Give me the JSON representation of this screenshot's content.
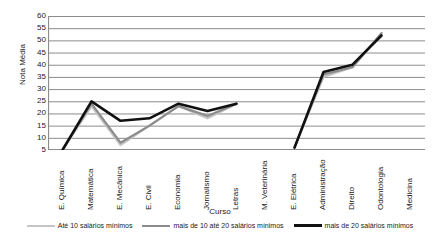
{
  "chart_data": {
    "type": "line",
    "title": "",
    "xlabel": "Curso",
    "ylabel": "Nota Média",
    "ylim": [
      5,
      60
    ],
    "yticks": [
      60,
      55,
      50,
      45,
      40,
      35,
      30,
      25,
      20,
      15,
      10,
      5
    ],
    "grid": true,
    "legend_position": "bottom",
    "categories": [
      "E. Química",
      "Matemática",
      "E. Mecânica",
      "E. Civil",
      "Economia",
      "Jornalismo",
      "Letras",
      "M. Veterinária",
      "E. Elétrica",
      "Administração",
      "Direito",
      "Odontologia",
      "Medicina"
    ],
    "series": [
      {
        "name": "Até 10 salários mínimos",
        "color": "#c4c4c4",
        "width": 2.2,
        "values": [
          5,
          23,
          7,
          15,
          23,
          18,
          24,
          null,
          6,
          35,
          39,
          53,
          null
        ]
      },
      {
        "name": "mais de 10 até 20 salários mínimos",
        "color": "#8c8c8c",
        "width": 2.2,
        "values": [
          5,
          24,
          8,
          15,
          23,
          19,
          24,
          null,
          6,
          36,
          39,
          53,
          null
        ]
      },
      {
        "name": "mais de 20 salários mínimos",
        "color": "#111111",
        "width": 2.6,
        "values": [
          5,
          25,
          17,
          18,
          24,
          21,
          24,
          null,
          6,
          37,
          40,
          52,
          null
        ]
      }
    ],
    "axis_color": "#8c8c8c",
    "grid_color": "#8c8c8c",
    "background": "#ffffff"
  }
}
